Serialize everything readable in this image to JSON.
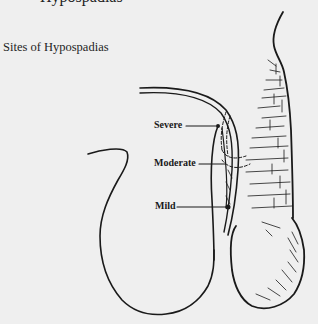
{
  "page": {
    "cut_heading": "Hypospadias",
    "figure_title": "Sites of Hypospadias"
  },
  "labels": [
    {
      "id": "severe",
      "text": "Severe"
    },
    {
      "id": "moderate",
      "text": "Moderate"
    },
    {
      "id": "mild",
      "text": "Mild"
    }
  ],
  "colors": {
    "background": "#efefef",
    "ink": "#1a1a1a"
  }
}
